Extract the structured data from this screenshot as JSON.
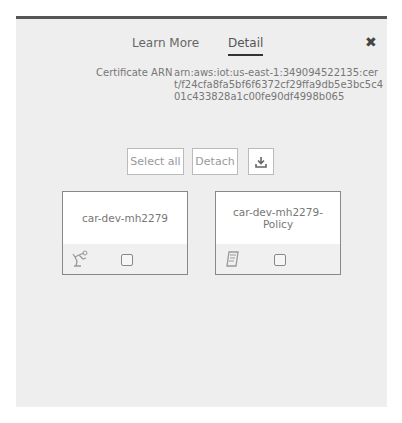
{
  "tabs": [
    {
      "label": "Learn More",
      "active": false
    },
    {
      "label": "Detail",
      "active": true
    }
  ],
  "close_label": "✖",
  "certificate": {
    "label": "Certificate ARN",
    "arn": "arn:aws:iot:us-east-1:349094522135:cert/f24cfa8fa5bf6f6372cf29ffa9db5e3bc5c401c433828a1c00fe90df4998b065"
  },
  "actions": {
    "select_all": "Select all",
    "detach": "Detach",
    "download_icon": "download-icon"
  },
  "cards": [
    {
      "title": "car-dev-mh2279",
      "icon": "thing-icon",
      "checked": false
    },
    {
      "title": "car-dev-mh2279-Policy",
      "icon": "policy-icon",
      "checked": false
    }
  ]
}
